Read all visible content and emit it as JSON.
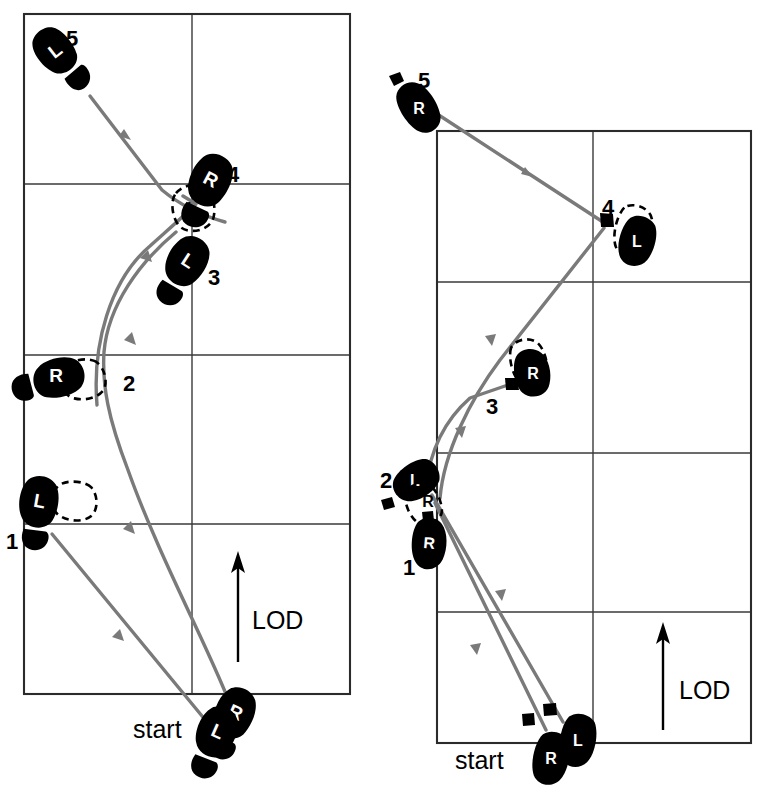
{
  "figure": {
    "title": "",
    "background_color": "#ffffff",
    "foot_color": "#000000",
    "track_color": "#7a7a7a",
    "grid_color": "#3a3a3a"
  },
  "diagrams": [
    {
      "id": "left-diagram",
      "name": "left-footwork-diagram",
      "grid": {
        "columns": 2,
        "rows": 4,
        "x": 24,
        "y": 14,
        "width": 326,
        "height": 680
      },
      "annotations": [
        {
          "name": "start-label",
          "text": "start",
          "x": 155,
          "y": 729
        },
        {
          "name": "lod-label",
          "text": "LOD",
          "x": 252,
          "y": 619
        }
      ],
      "steps": [
        {
          "number": "5",
          "foot": "L",
          "state": "solid",
          "label_x": 72,
          "label_y": 36
        },
        {
          "number": "4",
          "foot": "R",
          "state": "solid",
          "label_x": 231,
          "label_y": 174
        },
        {
          "number": "4",
          "foot": "L",
          "state": "dashed",
          "label_x": 0,
          "label_y": 0
        },
        {
          "number": "3",
          "foot": "L",
          "state": "solid",
          "label_x": 213,
          "label_y": 276
        },
        {
          "number": "2",
          "foot": "R",
          "state": "solid",
          "label_x": 128,
          "label_y": 382
        },
        {
          "number": "1",
          "foot": "L",
          "state": "solid",
          "label_x": 12,
          "label_y": 540
        },
        {
          "number": "start",
          "foot": "R",
          "state": "solid",
          "label_x": 0,
          "label_y": 0
        },
        {
          "number": "start",
          "foot": "L",
          "state": "solid",
          "label_x": 0,
          "label_y": 0
        }
      ]
    },
    {
      "id": "right-diagram",
      "name": "right-footwork-diagram",
      "grid": {
        "columns": 2,
        "rows": 4,
        "x": 437,
        "y": 131,
        "width": 314,
        "height": 612
      },
      "annotations": [
        {
          "name": "start-label",
          "text": "start",
          "x": 478,
          "y": 760
        },
        {
          "name": "lod-label",
          "text": "LOD",
          "x": 679,
          "y": 689
        }
      ],
      "steps": [
        {
          "number": "5",
          "foot": "R",
          "state": "solid",
          "label_x": 423,
          "label_y": 80
        },
        {
          "number": "4",
          "foot": "L",
          "state": "solid",
          "label_x": 608,
          "label_y": 208
        },
        {
          "number": "4",
          "foot": "L",
          "state": "dashed",
          "label_x": 0,
          "label_y": 0
        },
        {
          "number": "3",
          "foot": "R",
          "state": "solid",
          "label_x": 491,
          "label_y": 406
        },
        {
          "number": "2",
          "foot": "L",
          "state": "solid",
          "label_x": 387,
          "label_y": 480
        },
        {
          "number": "2",
          "foot": "R",
          "state": "dashed",
          "label_x": 0,
          "label_y": 0
        },
        {
          "number": "1",
          "foot": "R",
          "state": "solid",
          "label_x": 408,
          "label_y": 567
        },
        {
          "number": "start",
          "foot": "R",
          "state": "solid",
          "label_x": 0,
          "label_y": 0
        },
        {
          "number": "start",
          "foot": "L",
          "state": "solid",
          "label_x": 0,
          "label_y": 0
        }
      ]
    }
  ],
  "labels": {
    "n1": "1",
    "n2": "2",
    "n3": "3",
    "n4": "4",
    "n5": "5",
    "L": "L",
    "R": "R",
    "start": "start",
    "lod": "LOD"
  }
}
